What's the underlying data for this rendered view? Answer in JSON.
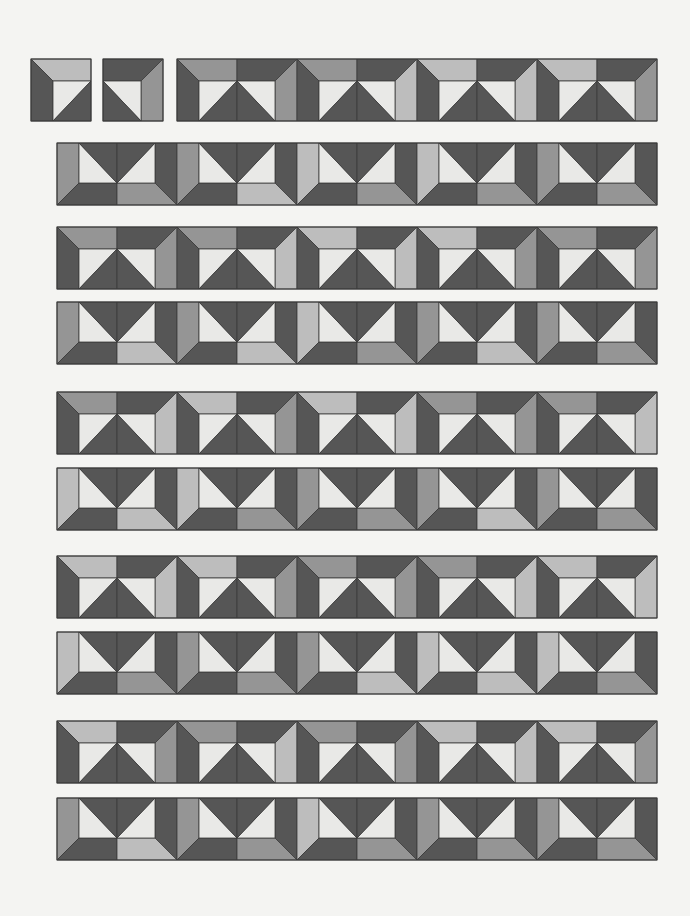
{
  "colors": {
    "background": "#f4f4f2",
    "dark": "#565656",
    "mid": "#959595",
    "light": "#bdbdbd",
    "white": "#e9e9e7",
    "outline": "#3a3a3a"
  },
  "tile": {
    "width": 60,
    "height": 62,
    "band": 22
  },
  "single_tiles": [
    {
      "name": "tile-a",
      "x": 31,
      "y": 59,
      "variant": "left",
      "shade": "L"
    },
    {
      "name": "tile-b",
      "x": 103,
      "y": 59,
      "variant": "right",
      "shade": "M"
    }
  ],
  "rows": [
    {
      "y": 59,
      "x": 177,
      "type": "A",
      "blocks": [
        [
          "M",
          "M"
        ],
        [
          "M",
          "L"
        ],
        [
          "L",
          "L"
        ],
        [
          "L",
          "M"
        ]
      ]
    },
    {
      "y": 143,
      "x": 57,
      "type": "B",
      "blocks": [
        [
          "M",
          "M"
        ],
        [
          "M",
          "L"
        ],
        [
          "L",
          "M"
        ],
        [
          "L",
          "M"
        ],
        [
          "M",
          "M"
        ]
      ]
    },
    {
      "y": 227,
      "x": 57,
      "type": "A",
      "blocks": [
        [
          "M",
          "M"
        ],
        [
          "M",
          "L"
        ],
        [
          "L",
          "L"
        ],
        [
          "L",
          "M"
        ],
        [
          "M",
          "M"
        ]
      ]
    },
    {
      "y": 302,
      "x": 57,
      "type": "B",
      "blocks": [
        [
          "M",
          "L"
        ],
        [
          "M",
          "L"
        ],
        [
          "L",
          "M"
        ],
        [
          "M",
          "L"
        ],
        [
          "M",
          "M"
        ]
      ]
    },
    {
      "y": 392,
      "x": 57,
      "type": "A",
      "blocks": [
        [
          "M",
          "L"
        ],
        [
          "L",
          "M"
        ],
        [
          "L",
          "L"
        ],
        [
          "M",
          "M"
        ],
        [
          "M",
          "L"
        ]
      ]
    },
    {
      "y": 468,
      "x": 57,
      "type": "B",
      "blocks": [
        [
          "L",
          "L"
        ],
        [
          "L",
          "M"
        ],
        [
          "M",
          "M"
        ],
        [
          "M",
          "L"
        ],
        [
          "M",
          "M"
        ]
      ]
    },
    {
      "y": 556,
      "x": 57,
      "type": "A",
      "blocks": [
        [
          "L",
          "L"
        ],
        [
          "L",
          "M"
        ],
        [
          "M",
          "M"
        ],
        [
          "M",
          "L"
        ],
        [
          "L",
          "L"
        ]
      ]
    },
    {
      "y": 632,
      "x": 57,
      "type": "B",
      "blocks": [
        [
          "L",
          "M"
        ],
        [
          "M",
          "M"
        ],
        [
          "M",
          "L"
        ],
        [
          "L",
          "L"
        ],
        [
          "L",
          "M"
        ]
      ]
    },
    {
      "y": 721,
      "x": 57,
      "type": "A",
      "blocks": [
        [
          "L",
          "M"
        ],
        [
          "M",
          "L"
        ],
        [
          "M",
          "M"
        ],
        [
          "L",
          "L"
        ],
        [
          "L",
          "M"
        ]
      ]
    },
    {
      "y": 798,
      "x": 57,
      "type": "B",
      "blocks": [
        [
          "M",
          "L"
        ],
        [
          "M",
          "M"
        ],
        [
          "L",
          "M"
        ],
        [
          "M",
          "M"
        ],
        [
          "M",
          "M"
        ]
      ]
    }
  ]
}
